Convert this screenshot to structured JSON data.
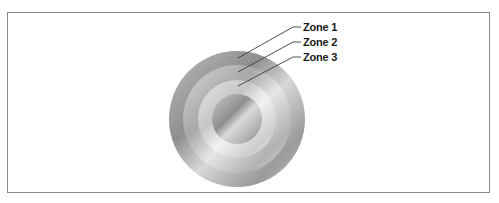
{
  "figure": {
    "type": "concentric-zones",
    "center": {
      "x": 237,
      "y": 119
    },
    "zones": [
      {
        "label": "Zone 1",
        "outer_radius": 68,
        "inner_radius": 54,
        "color_dark": "#9a9a9a",
        "color_light": "#d2d2d2",
        "label_y": 31,
        "leader_start": {
          "x": 238,
          "y": 58
        }
      },
      {
        "label": "Zone 2",
        "outer_radius": 54,
        "inner_radius": 39,
        "color_dark": "#b0b0b0",
        "color_light": "#e0e0e0",
        "label_y": 46,
        "leader_start": {
          "x": 238,
          "y": 72
        }
      },
      {
        "label": "Zone 3",
        "outer_radius": 39,
        "inner_radius": 25,
        "color_dark": "#c4c4c4",
        "color_light": "#ececec",
        "label_y": 61,
        "leader_start": {
          "x": 238,
          "y": 86
        }
      }
    ],
    "core": {
      "radius": 25,
      "color_dark": "#9e9e9e",
      "color_light": "#d6d6d6"
    },
    "leader_color": "#3a3a3a",
    "frame_color": "#8a8a8a"
  },
  "caption": {
    "text": ""
  }
}
